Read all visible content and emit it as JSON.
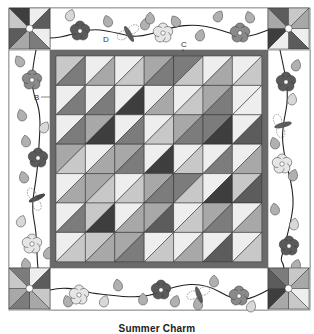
{
  "caption": "Summer Charm",
  "labels": {
    "B": "B",
    "C": "C",
    "D": "D"
  },
  "colors": {
    "tones": {
      "L": "#eeeeee",
      "LM": "#c8c8c8",
      "M": "#a8a8a8",
      "DM": "#7c7c7c",
      "D": "#5c5c5c",
      "X": "#3e3e3e"
    },
    "border_frame": "#6a6a6a",
    "background": "#ffffff",
    "vine": "#222222",
    "leaf": "#b0b0b0",
    "leaf_light": "#d8d8d8",
    "flower_dark": "#5a5a5a",
    "flower_mid": "#8a8a8a",
    "flower_light": "#e6e6e6"
  },
  "grid": {
    "rows": 7,
    "cols": 7,
    "cells": [
      [
        [
          "LM",
          "DM"
        ],
        [
          "L",
          "M"
        ],
        [
          "L",
          "LM"
        ],
        [
          "M",
          "DM"
        ],
        [
          "DM",
          "LM"
        ],
        [
          "L",
          "M"
        ],
        [
          "L",
          "LM"
        ]
      ],
      [
        [
          "L",
          "DM"
        ],
        [
          "L",
          "DM"
        ],
        [
          "L",
          "X"
        ],
        [
          "L",
          "M"
        ],
        [
          "L",
          "LM"
        ],
        [
          "M",
          "DM"
        ],
        [
          "L",
          "L"
        ]
      ],
      [
        [
          "L",
          "DM"
        ],
        [
          "M",
          "X"
        ],
        [
          "L",
          "DM"
        ],
        [
          "L",
          "LM"
        ],
        [
          "M",
          "DM"
        ],
        [
          "DM",
          "X"
        ],
        [
          "L",
          "D"
        ]
      ],
      [
        [
          "M",
          "LM"
        ],
        [
          "L",
          "M"
        ],
        [
          "M",
          "DM"
        ],
        [
          "L",
          "X"
        ],
        [
          "L",
          "LM"
        ],
        [
          "L",
          "DM"
        ],
        [
          "L",
          "M"
        ]
      ],
      [
        [
          "L",
          "M"
        ],
        [
          "M",
          "LM"
        ],
        [
          "L",
          "LM"
        ],
        [
          "M",
          "DM"
        ],
        [
          "DM",
          "LM"
        ],
        [
          "L",
          "X"
        ],
        [
          "LM",
          "D"
        ]
      ],
      [
        [
          "L",
          "DM"
        ],
        [
          "LM",
          "X"
        ],
        [
          "L",
          "M"
        ],
        [
          "M",
          "D"
        ],
        [
          "L",
          "LM"
        ],
        [
          "M",
          "DM"
        ],
        [
          "L",
          "M"
        ]
      ],
      [
        [
          "L",
          "LM"
        ],
        [
          "LM",
          "M"
        ],
        [
          "M",
          "DM"
        ],
        [
          "L",
          "LM"
        ],
        [
          "L",
          "M"
        ],
        [
          "L",
          "D"
        ],
        [
          "L",
          "LM"
        ]
      ]
    ]
  },
  "corner_blocks": [
    {
      "position": "top-left",
      "triangles": [
        "X",
        "L",
        "D",
        "L",
        "DM",
        "M",
        "D",
        "LM"
      ]
    },
    {
      "position": "top-right",
      "triangles": [
        "D",
        "LM",
        "M",
        "L",
        "D",
        "L",
        "X",
        "M"
      ]
    },
    {
      "position": "bottom-left",
      "triangles": [
        "DM",
        "L",
        "D",
        "LM",
        "M",
        "DM",
        "M",
        "LM"
      ]
    },
    {
      "position": "bottom-right",
      "triangles": [
        "DM",
        "LM",
        "M",
        "L",
        "LM",
        "M",
        "X",
        "D"
      ]
    }
  ]
}
